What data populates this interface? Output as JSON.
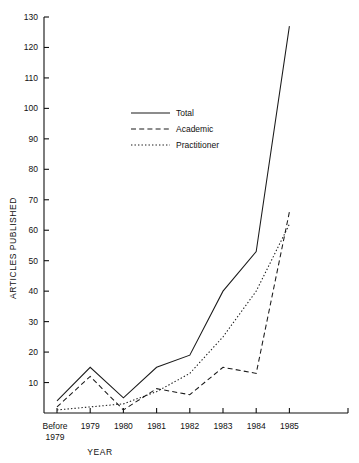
{
  "chart_data": {
    "type": "line",
    "title": "",
    "xlabel": "YEAR",
    "ylabel": "ARTICLES PUBLISHED",
    "categories": [
      "Before 1979",
      "1979",
      "1980",
      "1981",
      "1982",
      "1983",
      "1984",
      "1985"
    ],
    "category_lines": [
      [
        "Before",
        "1979"
      ],
      [
        "1979"
      ],
      [
        "1980"
      ],
      [
        "1981"
      ],
      [
        "1982"
      ],
      [
        "1983"
      ],
      [
        "1984"
      ],
      [
        "1985"
      ]
    ],
    "ylim": [
      0,
      130
    ],
    "ytick_step": 10,
    "yticks": [
      0,
      10,
      20,
      30,
      40,
      50,
      60,
      70,
      80,
      90,
      100,
      110,
      120,
      130
    ],
    "ytick_labels": [
      "0",
      "10",
      "20",
      "30",
      "40",
      "50",
      "60",
      "70",
      "80",
      "90",
      "100",
      "110",
      "120",
      "130"
    ],
    "grid": false,
    "legend_position": "upper-center-left",
    "series": [
      {
        "name": "Total",
        "style": "solid",
        "color": "#1a1a1a",
        "values": [
          4,
          15,
          5,
          15,
          19,
          40,
          53,
          127
        ]
      },
      {
        "name": "Academic",
        "style": "dashed",
        "color": "#1a1a1a",
        "values": [
          2,
          12,
          1,
          8,
          6,
          15,
          13,
          66
        ]
      },
      {
        "name": "Practitioner",
        "style": "dotted",
        "color": "#1a1a1a",
        "values": [
          1,
          2,
          3,
          7,
          13,
          25,
          40,
          62
        ]
      }
    ]
  },
  "legend": {
    "items": [
      {
        "label": "Total",
        "style": "solid"
      },
      {
        "label": "Academic",
        "style": "dashed"
      },
      {
        "label": "Practitioner",
        "style": "dotted"
      }
    ]
  },
  "axes": {
    "y_title": "ARTICLES PUBLISHED",
    "x_title": "YEAR"
  }
}
